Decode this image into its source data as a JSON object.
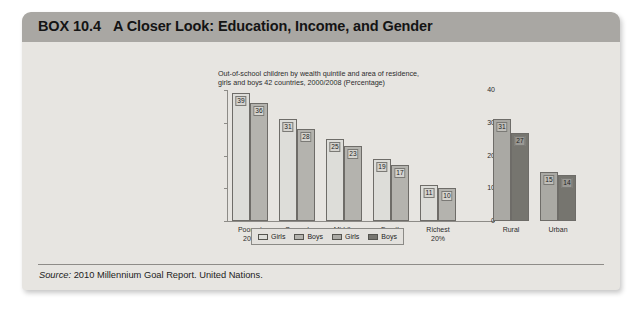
{
  "box": {
    "label": "BOX 10.4",
    "title": "A Closer Look: Education, Income, and Gender"
  },
  "source": {
    "lead": "Source:",
    "text": " 2010 Millennium Goal Report. United Nations."
  },
  "chart_data": {
    "type": "bar",
    "title": "Out-of-school children by wealth quintile and area of residence, girls and boys 42 countries, 2000/2008 (Percentage)",
    "title_line1": "Out-of-school children by wealth quintile and area of residence,",
    "title_line2": "girls and boys 42 countries, 2000/2008 (Percentage)",
    "xlabel": "",
    "ylabel": "",
    "ylim": [
      0,
      40
    ],
    "yticks": [
      0,
      10,
      20,
      30,
      40
    ],
    "grid": false,
    "legend_position": "bottom",
    "legend": [
      {
        "label": "Girls",
        "color": "#ddddd9"
      },
      {
        "label": "Boys",
        "color": "#b4b3ae"
      },
      {
        "label": "Girls",
        "color": "#aaa9a4"
      },
      {
        "label": "Boys",
        "color": "#76756f"
      }
    ],
    "groups": [
      {
        "name": "wealth-quintile",
        "categories": [
          "Poorest 20%",
          "Second 20%",
          "Middle 20%",
          "Fourth 20%",
          "Richest 20%"
        ],
        "category_lines": [
          [
            "Poorest",
            "20%"
          ],
          [
            "Second",
            "20%"
          ],
          [
            "Middle",
            "20%"
          ],
          [
            "Fourth",
            "20%"
          ],
          [
            "Richest",
            "20%"
          ]
        ],
        "series": [
          {
            "name": "Girls",
            "style": "lt-girls",
            "values": [
              39,
              31,
              25,
              19,
              11
            ]
          },
          {
            "name": "Boys",
            "style": "lt-boys",
            "values": [
              36,
              28,
              23,
              17,
              10
            ]
          }
        ]
      },
      {
        "name": "area-of-residence",
        "categories": [
          "Rural",
          "Urban"
        ],
        "category_lines": [
          [
            "Rural"
          ],
          [
            "Urban"
          ]
        ],
        "series": [
          {
            "name": "Girls",
            "style": "dk-girls",
            "values": [
              31,
              15
            ]
          },
          {
            "name": "Boys",
            "style": "dk-boys",
            "values": [
              27,
              14
            ]
          }
        ]
      }
    ]
  }
}
